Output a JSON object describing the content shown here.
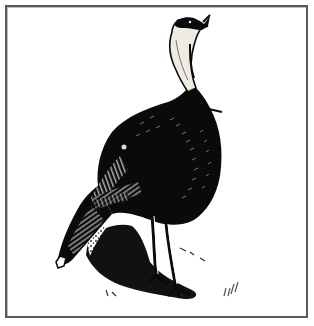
{
  "illustration": {
    "subject": "Wild turkey",
    "style": "black-and-white pen-and-ink engraving",
    "signature": "𝓌𝒻𝓁",
    "colors": {
      "ink": "#0a0a0a",
      "paper": "#ffffff",
      "border": "#5a5a5a",
      "neck_shade": "#e8e4dc"
    }
  }
}
